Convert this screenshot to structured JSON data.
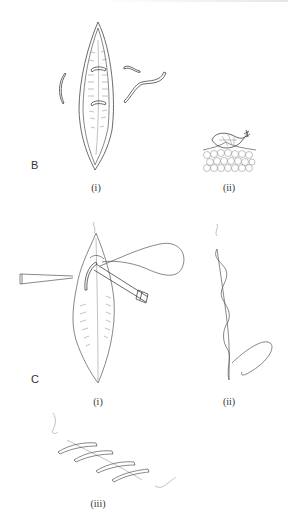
{
  "figure": {
    "panels": [
      {
        "label": "B",
        "subfigures": [
          {
            "label": "(i)",
            "depicts": "incision with interrupted stitches and loose suture segments"
          },
          {
            "label": "(ii)",
            "depicts": "cross-section of suture knot on tissue"
          }
        ]
      },
      {
        "label": "C",
        "subfigures": [
          {
            "label": "(i)",
            "depicts": "forceps and needle holder passing suture through incision edge"
          },
          {
            "label": "(ii)",
            "depicts": "continuous running suture along incision line"
          },
          {
            "label": "(iii)",
            "depicts": "completed continuous suture with diagonal crossings"
          }
        ]
      }
    ]
  }
}
